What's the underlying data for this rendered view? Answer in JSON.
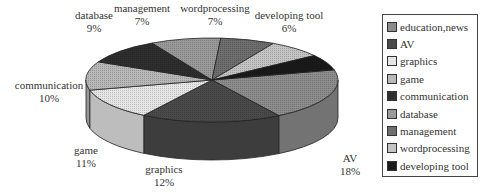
{
  "chart_data": {
    "type": "pie",
    "style": "3d",
    "title": "",
    "categories": [
      "education,news",
      "AV",
      "graphics",
      "game",
      "communication",
      "database",
      "management",
      "wordprocessing",
      "developing tool"
    ],
    "values": [
      20,
      18,
      12,
      11,
      10,
      9,
      7,
      7,
      6
    ],
    "unit": "%",
    "data_labels": [
      {
        "name": "education,",
        "value": "20%"
      },
      {
        "name": "AV",
        "value": "18%"
      },
      {
        "name": "graphics",
        "value": "12%"
      },
      {
        "name": "game",
        "value": "11%"
      },
      {
        "name": "communication",
        "value": "10%"
      },
      {
        "name": "database",
        "value": "9%"
      },
      {
        "name": "management",
        "value": "7%"
      },
      {
        "name": "wordprocessing",
        "value": "7%"
      },
      {
        "name": "developing tool",
        "value": "6%"
      }
    ],
    "colors": [
      "#8c8c8c",
      "#4a4a4a",
      "#e6e6e6",
      "#b8b8b8",
      "#2e2e2e",
      "#9a9a9a",
      "#6e6e6e",
      "#c4c4c4",
      "#1a1a1a"
    ],
    "legend": {
      "position": "right",
      "entries": [
        "education,news",
        "AV",
        "graphics",
        "game",
        "communication",
        "database",
        "management",
        "wordprocessing",
        "developing tool"
      ]
    }
  }
}
